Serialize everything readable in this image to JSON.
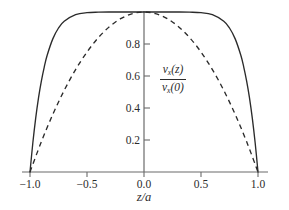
{
  "chart_data": {
    "type": "line",
    "title": "",
    "subtitle": "",
    "xlabel": "z/a",
    "ylabel": "v_x(z) / v_x(0)",
    "ylabel_numerator": "v",
    "ylabel_numerator_sub": "x",
    "ylabel_numerator_arg": "(z)",
    "ylabel_denominator": "v",
    "ylabel_denominator_sub": "x",
    "ylabel_denominator_arg": "(0)",
    "xlim": [
      -1.0,
      1.0
    ],
    "ylim": [
      0.0,
      1.0
    ],
    "grid": false,
    "legend": "none",
    "background_color": "#ffffff",
    "axis_color": "#6b6b6b",
    "curve_color": "#2b2b2b",
    "xticks": [
      {
        "value": -1.0,
        "label": "−1.0"
      },
      {
        "value": -0.5,
        "label": "−0.5"
      },
      {
        "value": 0.0,
        "label": "0.0"
      },
      {
        "value": 0.5,
        "label": "0.5"
      },
      {
        "value": 1.0,
        "label": "1.0"
      }
    ],
    "yticks": [
      {
        "value": 0.2,
        "label": "0.2"
      },
      {
        "value": 0.4,
        "label": "0.4"
      },
      {
        "value": 0.6,
        "label": "0.6"
      },
      {
        "value": 0.8,
        "label": "0.8"
      }
    ],
    "series": [
      {
        "name": "plug-flow profile",
        "style": "solid",
        "color": "#2b2b2b",
        "formula": "1 - |z/a|^8",
        "x": [
          -1.0,
          -0.975,
          -0.95,
          -0.925,
          -0.9,
          -0.875,
          -0.85,
          -0.8,
          -0.75,
          -0.7,
          -0.6,
          -0.5,
          -0.4,
          -0.3,
          -0.2,
          -0.1,
          0.0,
          0.1,
          0.2,
          0.3,
          0.4,
          0.5,
          0.6,
          0.7,
          0.75,
          0.8,
          0.85,
          0.875,
          0.9,
          0.925,
          0.95,
          0.975,
          1.0
        ],
        "y": [
          0.0,
          0.183,
          0.337,
          0.465,
          0.57,
          0.656,
          0.728,
          0.832,
          0.9,
          0.942,
          0.983,
          0.996,
          0.999,
          1.0,
          1.0,
          1.0,
          1.0,
          1.0,
          1.0,
          1.0,
          0.999,
          0.996,
          0.983,
          0.942,
          0.9,
          0.832,
          0.728,
          0.656,
          0.57,
          0.465,
          0.337,
          0.183,
          0.0
        ]
      },
      {
        "name": "parabolic profile",
        "style": "dashed",
        "color": "#2b2b2b",
        "formula": "1 - (z/a)^2",
        "x": [
          -1.0,
          -0.9,
          -0.8,
          -0.7,
          -0.6,
          -0.5,
          -0.4,
          -0.3,
          -0.2,
          -0.1,
          0.0,
          0.1,
          0.2,
          0.3,
          0.4,
          0.5,
          0.6,
          0.7,
          0.8,
          0.9,
          1.0
        ],
        "y": [
          0.0,
          0.19,
          0.36,
          0.51,
          0.64,
          0.75,
          0.84,
          0.91,
          0.96,
          0.99,
          1.0,
          0.99,
          0.96,
          0.91,
          0.84,
          0.75,
          0.64,
          0.51,
          0.36,
          0.19,
          0.0
        ]
      }
    ]
  }
}
